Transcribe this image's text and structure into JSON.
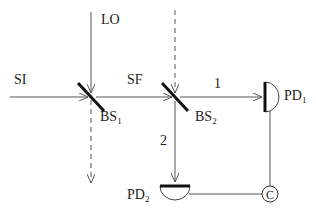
{
  "diagram": {
    "type": "optical homodyne setup",
    "colors": {
      "beam": "#555555",
      "splitter": "#111111",
      "text": "#222222",
      "background": "#ffffff"
    },
    "beams": {
      "signal_in": {
        "label": "SI"
      },
      "local_oscillator": {
        "label": "LO"
      },
      "signal_field": {
        "label": "SF"
      },
      "path_1": {
        "label": "1"
      },
      "path_2": {
        "label": "2"
      }
    },
    "components": {
      "bs1": {
        "label": "BS",
        "sub": "1"
      },
      "bs2": {
        "label": "BS",
        "sub": "2"
      },
      "pd1": {
        "label": "PD",
        "sub": "1"
      },
      "pd2": {
        "label": "PD",
        "sub": "2"
      },
      "correlator": {
        "label": "C"
      }
    }
  }
}
